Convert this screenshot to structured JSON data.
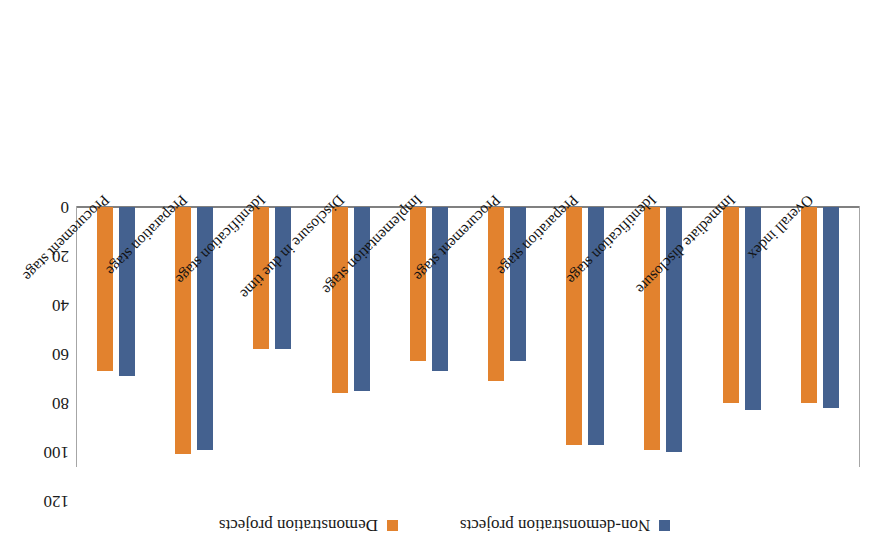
{
  "chart_data": {
    "type": "bar",
    "title": "",
    "subtitle": "",
    "xlabel": "",
    "ylabel": "",
    "ylim": [
      0,
      120
    ],
    "yticks": [
      0,
      20,
      40,
      60,
      80,
      100,
      120
    ],
    "grid": false,
    "orientation": "vertical",
    "rotated_180": true,
    "legend_position": "top-center",
    "categories": [
      "Overall index",
      "Immediate disclosure",
      "Identification stage",
      "Preparation stage",
      "Procurement stage",
      "Implementation stage",
      "Disclosure in due time",
      "Identification stage",
      "Preparation stage",
      "Procurement stage"
    ],
    "series": [
      {
        "name": "Non-demonstration projects",
        "color": "#44618f",
        "values": [
          82,
          83,
          100,
          97,
          63,
          67,
          75,
          58,
          99,
          69
        ]
      },
      {
        "name": "Demonstration projects",
        "color": "#e2822e",
        "values": [
          80,
          80,
          99,
          97,
          71,
          63,
          76,
          58,
          101,
          67
        ]
      }
    ]
  },
  "legend": {
    "items": [
      {
        "label": "Non-demonstration projects",
        "color": "#44618f",
        "swatch_icon": "square-swatch-icon"
      },
      {
        "label": "Demonstration projects",
        "color": "#e2822e",
        "swatch_icon": "square-swatch-icon"
      }
    ]
  },
  "axis": {
    "y_tick_labels": [
      "0",
      "20",
      "40",
      "60",
      "80",
      "100",
      "120"
    ]
  }
}
